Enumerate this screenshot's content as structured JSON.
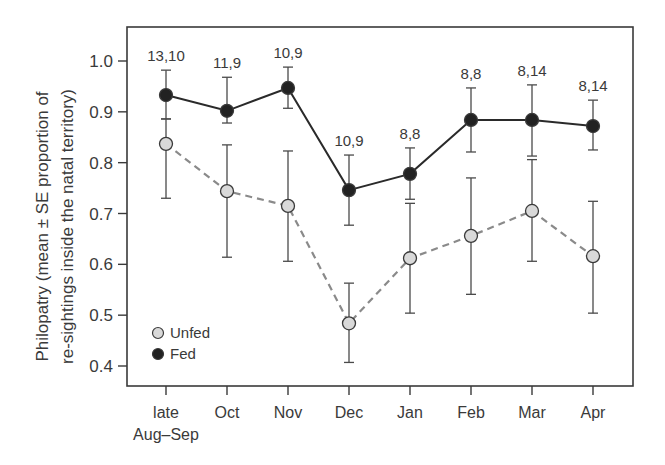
{
  "chart_data": {
    "type": "line",
    "title": "",
    "xlabel": "",
    "ylabel": "Philopatry (mean ± SE proportion of re-sightings inside the natal territory)",
    "ylabel_lines": [
      "Philopatry (mean ± SE proportion of",
      "re-sightings inside the natal territory)"
    ],
    "categories": [
      "late Aug–Sep",
      "Oct",
      "Nov",
      "Dec",
      "Jan",
      "Feb",
      "Mar",
      "Apr"
    ],
    "category_lines": [
      [
        "late",
        "Aug–Sep"
      ],
      [
        "Oct"
      ],
      [
        "Nov"
      ],
      [
        "Dec"
      ],
      [
        "Jan"
      ],
      [
        "Feb"
      ],
      [
        "Mar"
      ],
      [
        "Apr"
      ]
    ],
    "yticks": [
      0.4,
      0.5,
      0.6,
      0.7,
      0.8,
      0.9,
      1.0
    ],
    "ytick_labels": [
      "0.4",
      "0.5",
      "0.6",
      "0.7",
      "0.8",
      "0.9",
      "1.0"
    ],
    "ylim": [
      0.36,
      1.07
    ],
    "grid": false,
    "legend_position": "lower left",
    "annotations": [
      "13,10",
      "11,9",
      "10,9",
      "10,9",
      "8,8",
      "8,8",
      "8,14",
      "8,14"
    ],
    "series": [
      {
        "name": "Unfed",
        "marker": "open-circle",
        "line_style": "dashed",
        "marker_fill": "#d9d9d9",
        "line_color": "#8a8a8a",
        "values": [
          0.837,
          0.744,
          0.715,
          0.484,
          0.612,
          0.656,
          0.705,
          0.616
        ],
        "err_upper": [
          0.886,
          0.835,
          0.823,
          0.563,
          0.72,
          0.77,
          0.806,
          0.724
        ],
        "err_lower": [
          0.73,
          0.614,
          0.606,
          0.407,
          0.504,
          0.541,
          0.606,
          0.504
        ]
      },
      {
        "name": "Fed",
        "marker": "filled-circle",
        "line_style": "solid",
        "marker_fill": "#222222",
        "line_color": "#2a2a2a",
        "values": [
          0.933,
          0.902,
          0.947,
          0.746,
          0.778,
          0.884,
          0.884,
          0.872
        ],
        "err_upper": [
          0.982,
          0.968,
          0.988,
          0.815,
          0.829,
          0.947,
          0.953,
          0.923
        ],
        "err_lower": [
          0.886,
          0.878,
          0.907,
          0.677,
          0.728,
          0.821,
          0.813,
          0.825
        ]
      }
    ]
  },
  "legend": {
    "items": [
      {
        "label": "Unfed",
        "fill": "#d9d9d9"
      },
      {
        "label": "Fed",
        "fill": "#222222"
      }
    ]
  },
  "colors": {
    "axis": "#3a3a3a",
    "errorbar": "#4a4a4a",
    "text": "#3a3a3a"
  }
}
